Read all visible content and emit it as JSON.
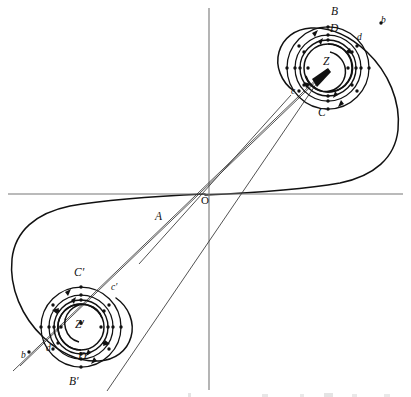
{
  "figure": {
    "kind": "mathematical-diagram",
    "background_color": "#ffffff",
    "ink_color": "#111111",
    "axes": {
      "origin_label": "O",
      "origin_point": [
        206,
        194
      ],
      "x_axis": {
        "from": [
          8,
          194
        ],
        "to": [
          403,
          194
        ]
      },
      "y_axis": {
        "from": [
          209,
          8
        ],
        "to": [
          209,
          390
        ]
      }
    },
    "poles": [
      {
        "name": "Z",
        "label": "Z",
        "center": [
          328,
          68
        ],
        "circle_radii": [
          24,
          28,
          33,
          41
        ]
      },
      {
        "name": "Z-prime",
        "label": "Z′",
        "center": [
          81,
          327
        ],
        "circle_radii": [
          23,
          27,
          32,
          40
        ]
      }
    ],
    "labels": [
      {
        "text": "B",
        "x": 331,
        "y": 7,
        "size": "cap"
      },
      {
        "text": "b",
        "x": 381,
        "y": 16,
        "size": "low"
      },
      {
        "text": "D",
        "x": 330,
        "y": 24,
        "size": "cap"
      },
      {
        "text": "d",
        "x": 357,
        "y": 34,
        "size": "low"
      },
      {
        "text": "Z",
        "x": 324,
        "y": 57,
        "size": "cap"
      },
      {
        "text": "c",
        "x": 291,
        "y": 88,
        "size": "low"
      },
      {
        "text": "C",
        "x": 318,
        "y": 108,
        "size": "cap"
      },
      {
        "text": "O",
        "x": 201,
        "y": 196,
        "size": "O"
      },
      {
        "text": "A",
        "x": 155,
        "y": 212,
        "size": "cap"
      },
      {
        "text": "C′",
        "x": 74,
        "y": 268,
        "size": "cap"
      },
      {
        "text": "c′",
        "x": 111,
        "y": 284,
        "size": "low"
      },
      {
        "text": "Z′",
        "x": 75,
        "y": 320,
        "size": "cap"
      },
      {
        "text": "b",
        "x": 21,
        "y": 352,
        "size": "low"
      },
      {
        "text": "d′",
        "x": 46,
        "y": 345,
        "size": "low"
      },
      {
        "text": "D′",
        "x": 78,
        "y": 352,
        "size": "cap"
      },
      {
        "text": "B′",
        "x": 69,
        "y": 377,
        "size": "cap"
      }
    ],
    "tick_dots_upper": [
      [
        328,
        27
      ],
      [
        303,
        44
      ],
      [
        303,
        92
      ],
      [
        328,
        109
      ],
      [
        353,
        92
      ],
      [
        353,
        44
      ],
      [
        328,
        40
      ],
      [
        307,
        68
      ],
      [
        349,
        68
      ],
      [
        328,
        96
      ],
      [
        328,
        35
      ],
      [
        328,
        101
      ],
      [
        300,
        68
      ],
      [
        356,
        68
      ]
    ],
    "tick_dots_lower": [
      [
        81,
        287
      ],
      [
        59,
        303
      ],
      [
        59,
        351
      ],
      [
        81,
        367
      ],
      [
        103,
        351
      ],
      [
        103,
        303
      ],
      [
        81,
        300
      ],
      [
        60,
        327
      ],
      [
        102,
        327
      ],
      [
        81,
        354
      ],
      [
        81,
        295
      ],
      [
        81,
        359
      ],
      [
        53,
        327
      ],
      [
        109,
        327
      ]
    ],
    "rays": [
      {
        "from": [
          328,
          68
        ],
        "to": [
          12,
          372
        ]
      },
      {
        "from": [
          328,
          68
        ],
        "to": [
          20,
          366
        ]
      },
      {
        "from": [
          324,
          72
        ],
        "to": [
          108,
          390
        ]
      },
      {
        "from": [
          140,
          263
        ],
        "to": [
          290,
          96
        ]
      }
    ]
  }
}
